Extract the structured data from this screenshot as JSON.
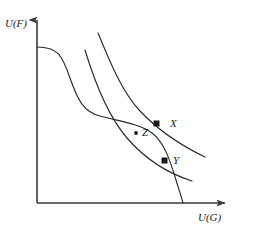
{
  "figure": {
    "background_color": "#ffffff",
    "stroke_color": "#2b2b2b",
    "axis_color": "#3a3a3a",
    "width": 261,
    "height": 233
  },
  "axes": {
    "y_label": "U(F)",
    "x_label": "U(G)",
    "origin": {
      "x": 37,
      "y": 203
    },
    "y_axis_top": {
      "x": 37,
      "y": 14
    },
    "x_axis_right": {
      "x": 232,
      "y": 203
    },
    "arrowheads": true,
    "ticks": [],
    "gridlines": false
  },
  "points": [
    {
      "name": "X",
      "label": "X",
      "marker": "filled-square",
      "x": 157,
      "y": 124,
      "description": "tangency of upper indifference curve with frontier"
    },
    {
      "name": "Y",
      "label": "Y",
      "marker": "filled-square",
      "x": 165,
      "y": 161,
      "description": "tangency of lower indifference curve with frontier"
    },
    {
      "name": "Z",
      "label": "Z",
      "marker": "filled-dot",
      "x": 136,
      "y": 133,
      "description": "interior point between the two tangencies"
    }
  ],
  "curves": [
    {
      "name": "production-possibility-frontier",
      "kind": "s-shaped-frontier",
      "path": "M 37,47 C 58,47 62,55 70,78 C 78,101 84,112 100,116 C 118,121 140,124 152,133 C 164,142 170,160 176,180 C 180,193 182,199 183,203"
    },
    {
      "name": "indifference-curve-upper",
      "kind": "convex-decreasing",
      "path": "M 98,33 C 110,62 122,92 140,111 C 160,132 184,147 205,157"
    },
    {
      "name": "indifference-curve-lower",
      "kind": "convex-decreasing",
      "path": "M 85,50 C 95,83 108,116 127,138 C 146,160 170,174 192,181"
    }
  ],
  "chart_data": {
    "type": "line",
    "title": "",
    "xlabel": "U(G)",
    "ylabel": "U(F)",
    "grid": false,
    "legend": "none",
    "annotations": [
      "X",
      "Y",
      "Z"
    ],
    "series": [
      {
        "name": "production-possibility-frontier"
      },
      {
        "name": "indifference-curve-upper"
      },
      {
        "name": "indifference-curve-lower"
      }
    ]
  }
}
